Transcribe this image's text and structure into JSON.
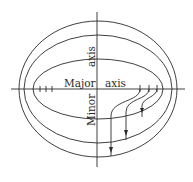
{
  "diagram": {
    "title": "",
    "labels": {
      "major_word": "Major",
      "major_axis_word": "axis",
      "minor_word": "Minor",
      "minor_axis_word": "axis"
    },
    "axes": {
      "horizontal": {
        "name": "Major axis",
        "x1": 11,
        "x2": 185,
        "y": 89
      },
      "vertical": {
        "name": "Minor axis",
        "x": 97,
        "y1": 12,
        "y2": 167
      }
    },
    "ellipses": [
      {
        "name": "outer",
        "cx": 98,
        "cy": 89,
        "rx": 79,
        "ry": 68
      },
      {
        "name": "middle",
        "cx": 98,
        "cy": 89,
        "rx": 74,
        "ry": 54
      },
      {
        "name": "inner",
        "cx": 98,
        "cy": 89,
        "rx": 65,
        "ry": 30
      }
    ],
    "tick_marks": {
      "left": [
        40,
        46,
        52
      ],
      "right": [
        140,
        149,
        157
      ]
    },
    "flow_lines": [
      {
        "from_x": 157,
        "to": "inner",
        "arrow_y": 112
      },
      {
        "from_x": 149,
        "to": "middle",
        "arrow_y": 134
      },
      {
        "from_x": 140,
        "to": "outer",
        "arrow_y": 151
      }
    ],
    "colors": {
      "line": "#2a2a2a",
      "background": "#ffffff"
    }
  }
}
